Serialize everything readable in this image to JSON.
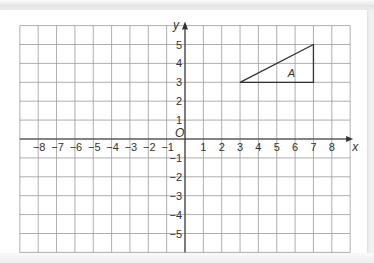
{
  "diagram": {
    "type": "coordinate-grid",
    "x_axis": {
      "label": "x",
      "range": [
        -9,
        9
      ],
      "tick_labels": [
        "−8",
        "−7",
        "−6",
        "−5",
        "−4",
        "−3",
        "−2",
        "−1",
        "1",
        "2",
        "3",
        "4",
        "5",
        "6",
        "7",
        "8"
      ],
      "tick_values": [
        -8,
        -7,
        -6,
        -5,
        -4,
        -3,
        -2,
        -1,
        1,
        2,
        3,
        4,
        5,
        6,
        7,
        8
      ]
    },
    "y_axis": {
      "label": "y",
      "range": [
        -6,
        6
      ],
      "tick_labels": [
        "5",
        "4",
        "3",
        "2",
        "1",
        "−1",
        "−2",
        "−3",
        "−4",
        "−5"
      ],
      "tick_values": [
        5,
        4,
        3,
        2,
        1,
        -1,
        -2,
        -3,
        -4,
        -5
      ]
    },
    "origin_label": "O",
    "shapes": [
      {
        "name": "A",
        "type": "triangle",
        "vertices": [
          [
            3,
            3
          ],
          [
            7,
            3
          ],
          [
            7,
            5
          ]
        ],
        "label_position": [
          5.8,
          3.5
        ]
      }
    ],
    "colors": {
      "grid": "#9a9a9a",
      "axis": "#333333",
      "shape": "#333333",
      "paper": "#ffffff"
    }
  }
}
